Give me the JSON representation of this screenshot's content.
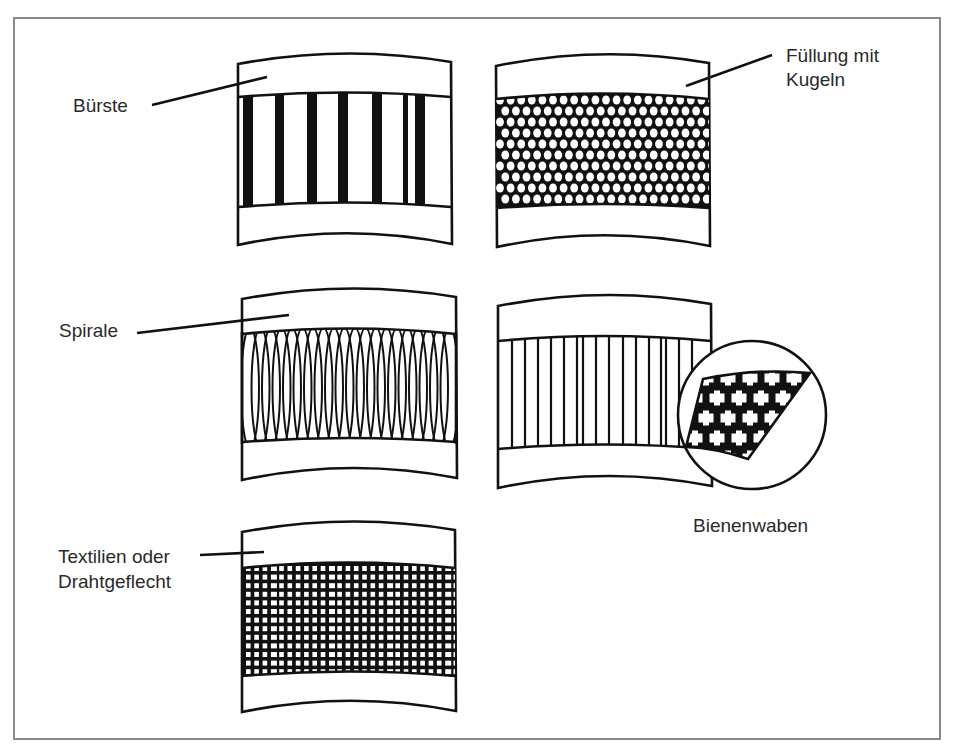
{
  "diagram": {
    "panels": [
      {
        "id": "buerste",
        "label_lines": [
          "Bürste"
        ],
        "pattern": "brush"
      },
      {
        "id": "kugeln",
        "label_lines": [
          "Füllung mit",
          "Kugeln"
        ],
        "pattern": "balls"
      },
      {
        "id": "spirale",
        "label_lines": [
          "Spirale"
        ],
        "pattern": "spiral"
      },
      {
        "id": "bienenwaben",
        "label_lines": [
          "Bienenwaben"
        ],
        "pattern": "honeycomb"
      },
      {
        "id": "textilien",
        "label_lines": [
          "Textilien oder",
          "Drahtgeflecht"
        ],
        "pattern": "mesh"
      }
    ]
  },
  "colors": {
    "ink": "#111111",
    "frame": "#8a8a8a",
    "label": "#2a2a2a",
    "background": "#ffffff"
  }
}
